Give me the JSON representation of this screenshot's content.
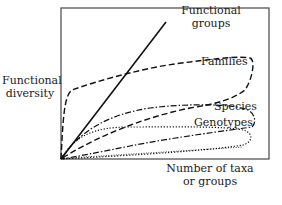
{
  "axes": {
    "y_label_line1": "Functional",
    "y_label_line2": "diversity",
    "x_label_line1": "Number of taxa",
    "x_label_line2": "or groups"
  },
  "curves": [
    {
      "name": "Functional groups",
      "label_line1": "Functional",
      "label_line2": "groups",
      "style": "solid"
    },
    {
      "name": "Families",
      "label": "Families",
      "style": "dashed"
    },
    {
      "name": "Species",
      "label": "Species",
      "style": "dash-dot"
    },
    {
      "name": "Genotypes",
      "label": "Genotypes",
      "style": "dotted"
    }
  ],
  "colors": {
    "line": "#1a1a1a",
    "frame": "#555555",
    "background": "#ffffff"
  }
}
